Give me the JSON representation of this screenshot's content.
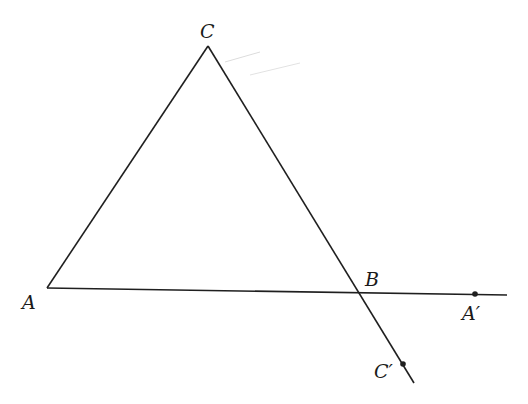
{
  "diagram": {
    "type": "geometry",
    "stroke_color": "#1f1f1f",
    "background": "#ffffff",
    "points": {
      "A": {
        "label": "A",
        "x": 47,
        "y": 288
      },
      "B": {
        "label": "B",
        "x": 359,
        "y": 292
      },
      "C": {
        "label": "C",
        "x": 208,
        "y": 46
      },
      "A_prime": {
        "label": "A′",
        "x": 475,
        "y": 294
      },
      "C_prime": {
        "label": "C′",
        "x": 403,
        "y": 364
      }
    },
    "segments": [
      {
        "name": "AC",
        "from": "A",
        "to": "C"
      },
      {
        "name": "CB-extended",
        "from": "C",
        "to": "C_prime",
        "extends_to": {
          "x": 414,
          "y": 383
        }
      },
      {
        "name": "AB-extended",
        "from": "A",
        "to": "A_prime",
        "extends_to": {
          "x": 507,
          "y": 295
        }
      }
    ],
    "marked_points": [
      "A_prime",
      "C_prime"
    ]
  }
}
